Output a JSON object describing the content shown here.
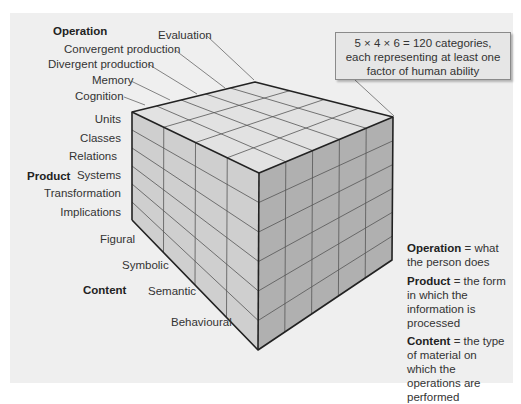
{
  "diagram": {
    "dimensions": {
      "operation": {
        "heading": "Operation",
        "items": [
          "Evaluation",
          "Convergent production",
          "Divergent production",
          "Memory",
          "Cognition"
        ]
      },
      "product": {
        "heading": "Product",
        "items": [
          "Units",
          "Classes",
          "Relations",
          "Systems",
          "Transformation",
          "Implications"
        ]
      },
      "content": {
        "heading": "Content",
        "items": [
          "Figural",
          "Symbolic",
          "Semantic",
          "Behavioural"
        ]
      }
    },
    "callout": {
      "line1": "5 × 4 × 6 = 120 categories,",
      "line2": "each representing at least one",
      "line3": "factor of human ability"
    },
    "legend": [
      {
        "term": "Operation",
        "definition": " = what the person does"
      },
      {
        "term": "Product",
        "definition": " = the form in which the information is processed"
      },
      {
        "term": "Content",
        "definition": " = the type of material on which the operations are performed"
      }
    ],
    "colors": {
      "background": "#efefef",
      "top_face": "#e2e2e2",
      "left_face": "#cfcfcf",
      "right_face": "#b0b0b0",
      "edge": "#222222",
      "grid": "#555555"
    }
  }
}
